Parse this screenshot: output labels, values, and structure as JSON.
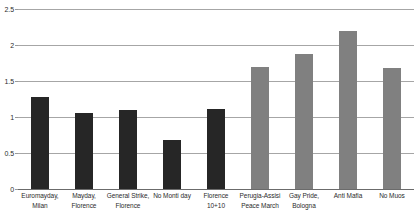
{
  "chart_data": {
    "type": "bar",
    "title": "",
    "subtitle": "",
    "xlabel": "",
    "ylabel": "",
    "ylim": [
      0,
      2.5
    ],
    "ytick_labels": [
      "2.5",
      "2",
      "1.5",
      "1",
      "0.5",
      "0"
    ],
    "ytick_values": [
      2.5,
      2,
      1.5,
      1,
      0.5,
      0
    ],
    "grid": true,
    "legend": false,
    "legend_position": "none",
    "orientation": "vertical",
    "categories": [
      "Euromayday,\nMilan",
      "Mayday,\nFlorence",
      "General Strike,\nFlorence",
      "No Monti day",
      "Florence\n10+10",
      "Perugia-Assisi\nPeace March",
      "Gay Pride,\nBologna",
      "Anti Mafia",
      "No Muos"
    ],
    "values": [
      1.28,
      1.06,
      1.1,
      0.68,
      1.11,
      1.7,
      1.88,
      2.19,
      1.68
    ],
    "bar_colors": [
      "#262626",
      "#262626",
      "#262626",
      "#262626",
      "#262626",
      "#808080",
      "#808080",
      "#808080",
      "#808080"
    ],
    "colors": {
      "dark_series": "#262626",
      "gray_series": "#808080",
      "gridline": "#a6a6a6",
      "axis": "#6b6b6b",
      "text": "#2b2b2b",
      "background": "#ffffff"
    }
  }
}
